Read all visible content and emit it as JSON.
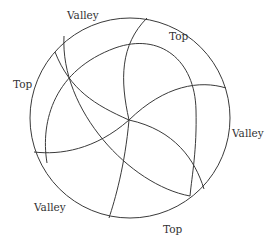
{
  "diagram": {
    "type": "circular-pinwheel",
    "stroke_color": "#3a3a3a",
    "label_color": "#333333",
    "labels": [
      {
        "text": "Valley",
        "x": 67,
        "y": 10
      },
      {
        "text": "Top",
        "x": 169,
        "y": 31
      },
      {
        "text": "Top",
        "x": 13,
        "y": 79
      },
      {
        "text": "Valley",
        "x": 232,
        "y": 128
      },
      {
        "text": "Valley",
        "x": 34,
        "y": 202
      },
      {
        "text": "Top",
        "x": 163,
        "y": 224
      }
    ]
  }
}
